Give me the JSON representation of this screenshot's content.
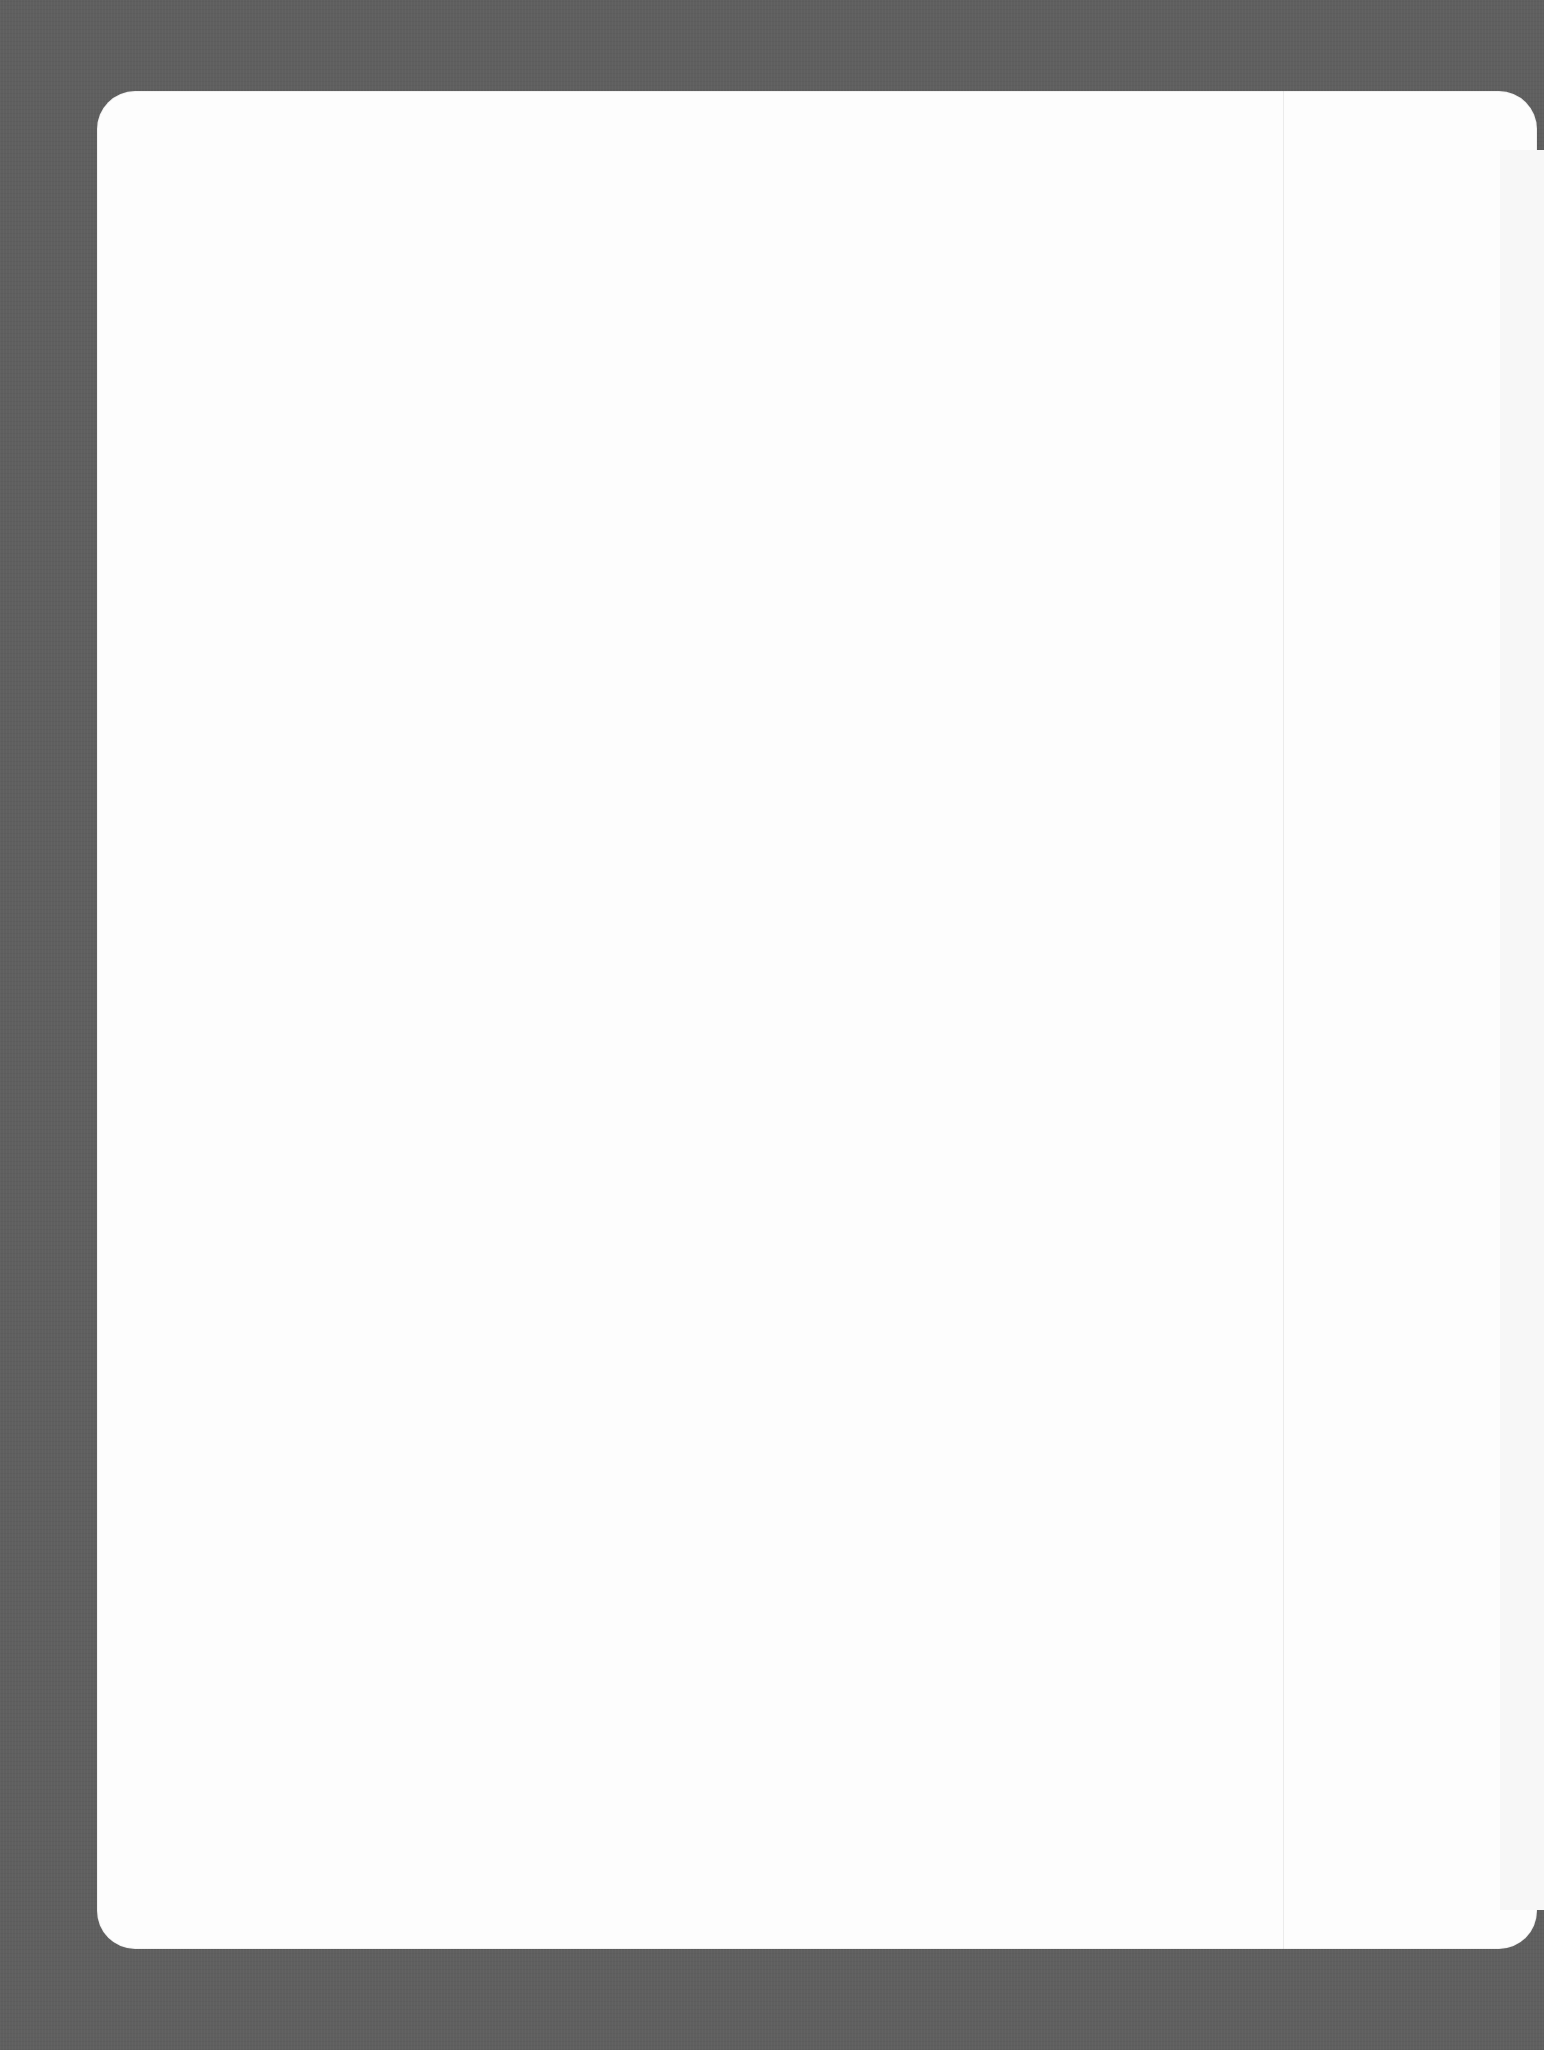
{
  "document": {
    "type": "decorative-page-border",
    "colors": {
      "frame": "#5f5f5f",
      "panel": "#fdfdfd",
      "icons": "#f4f4f4"
    },
    "panel": {
      "shape": "rounded-rectangle",
      "content": ""
    }
  },
  "border": {
    "top": [
      "heart",
      "star",
      "heart",
      "star",
      "heart",
      "star",
      "heart",
      "star",
      "heart",
      "star",
      "heart",
      "star",
      "heart",
      "star",
      "heart",
      "star",
      "heart",
      "star"
    ],
    "bottom": [
      "star",
      "heart",
      "star",
      "heart",
      "star",
      "heart",
      "star",
      "heart",
      "star",
      "heart",
      "star",
      "heart",
      "star",
      "heart",
      "star",
      "heart",
      "star",
      "heart"
    ],
    "left": [
      "star",
      "heart",
      "star",
      "heart",
      "star",
      "heart",
      "star",
      "heart",
      "star",
      "heart",
      "star",
      "heart",
      "star",
      "heart",
      "star",
      "heart",
      "star",
      "heart",
      "star",
      "heart",
      "star",
      "heart"
    ]
  }
}
